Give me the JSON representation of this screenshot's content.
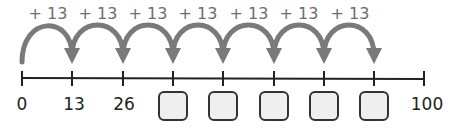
{
  "number_line": {
    "start_label": "0",
    "end_label": "100",
    "known_labels": [
      "13",
      "26"
    ],
    "jump_label": "+ 13",
    "jump_count": 7,
    "blank_boxes": 5,
    "ticks_x": [
      22,
      72,
      123,
      173,
      223,
      274,
      324,
      374
    ],
    "end_x": 424
  },
  "colors": {
    "arc": "#7a7a7a",
    "line": "#222222",
    "box_fill": "#efefef"
  }
}
